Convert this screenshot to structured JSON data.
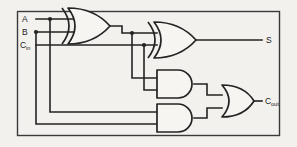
{
  "diagram": {
    "background_color": "#f2f1ee",
    "line_color": "#232323",
    "frame_color": "#3a3a3a"
  },
  "inputs": [
    {
      "id": "in-a",
      "label": "A",
      "sub": "",
      "y": 19
    },
    {
      "id": "in-b",
      "label": "B",
      "sub": "",
      "y": 32
    },
    {
      "id": "in-cin",
      "label": "C",
      "sub": "in",
      "y": 45
    }
  ],
  "outputs": [
    {
      "id": "out-s",
      "label": "S",
      "sub": "",
      "y": 40
    },
    {
      "id": "out-cout",
      "label": "C",
      "sub": "out",
      "y": 101
    }
  ],
  "gates": [
    {
      "id": "xor1",
      "type": "XOR",
      "label": "XOR"
    },
    {
      "id": "xor2",
      "type": "XOR",
      "label": "XOR"
    },
    {
      "id": "and1",
      "type": "AND",
      "label": "AND"
    },
    {
      "id": "and2",
      "type": "AND",
      "label": "AND"
    },
    {
      "id": "or1",
      "type": "OR",
      "label": "OR"
    }
  ]
}
